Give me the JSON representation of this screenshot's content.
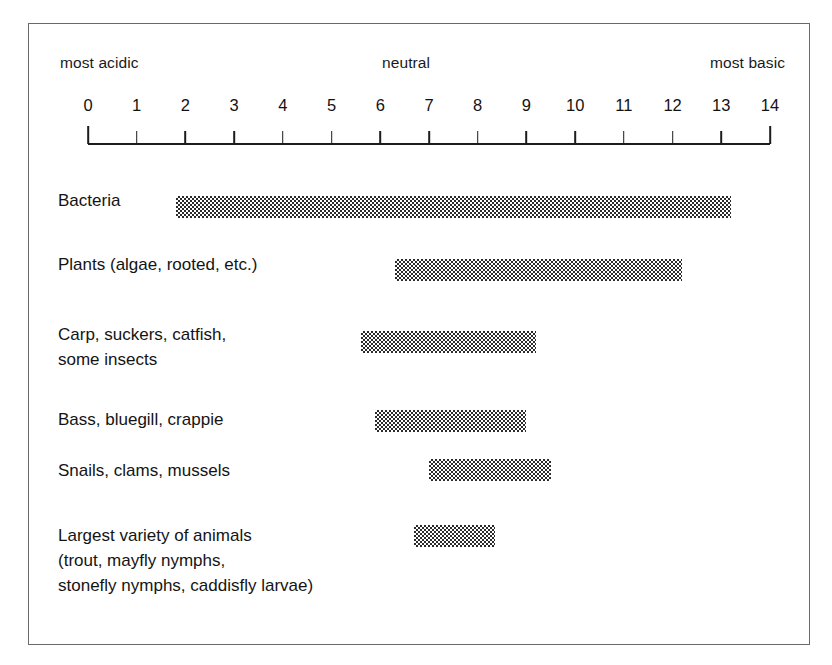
{
  "figure": {
    "frame_border_color": "#6a6a6a",
    "bar_fill_color": "#2b2b2b",
    "background_color": "#ffffff"
  },
  "scale": {
    "left_label": "most acidic",
    "center_label": "neutral",
    "right_label": "most basic",
    "ticks": [
      "0",
      "1",
      "2",
      "3",
      "4",
      "5",
      "6",
      "7",
      "8",
      "9",
      "10",
      "11",
      "12",
      "13",
      "14"
    ]
  },
  "rows": [
    {
      "label": "Bacteria",
      "start": 1.8,
      "end": 13.2
    },
    {
      "label": "Plants (algae, rooted, etc.)",
      "start": 6.3,
      "end": 12.2
    },
    {
      "label": "Carp, suckers, catfish,\nsome insects",
      "start": 5.6,
      "end": 9.2
    },
    {
      "label": "Bass, bluegill, crappie",
      "start": 5.9,
      "end": 9.0
    },
    {
      "label": "Snails, clams, mussels",
      "start": 7.0,
      "end": 9.5
    },
    {
      "label": "Largest variety of animals\n(trout, mayfly nymphs,\nstonefly nymphs, caddisfly larvae)",
      "start": 6.7,
      "end": 8.35
    }
  ],
  "chart_data": {
    "type": "bar",
    "xlabel": "pH",
    "ylabel": "",
    "xlim": [
      0,
      14
    ],
    "grid": false,
    "legend": "none",
    "orientation": "horizontal-range",
    "annotations": [
      "most acidic",
      "neutral",
      "most basic"
    ],
    "xticks": [
      0,
      1,
      2,
      3,
      4,
      5,
      6,
      7,
      8,
      9,
      10,
      11,
      12,
      13,
      14
    ],
    "categories": [
      "Bacteria",
      "Plants (algae, rooted, etc.)",
      "Carp, suckers, catfish, some insects",
      "Bass, bluegill, crappie",
      "Snails, clams, mussels",
      "Largest variety of animals (trout, mayfly nymphs, stonefly nymphs, caddisfly larvae)"
    ],
    "ranges": [
      [
        1.8,
        13.2
      ],
      [
        6.3,
        12.2
      ],
      [
        5.6,
        9.2
      ],
      [
        5.9,
        9.0
      ],
      [
        7.0,
        9.5
      ],
      [
        6.7,
        8.35
      ]
    ]
  }
}
